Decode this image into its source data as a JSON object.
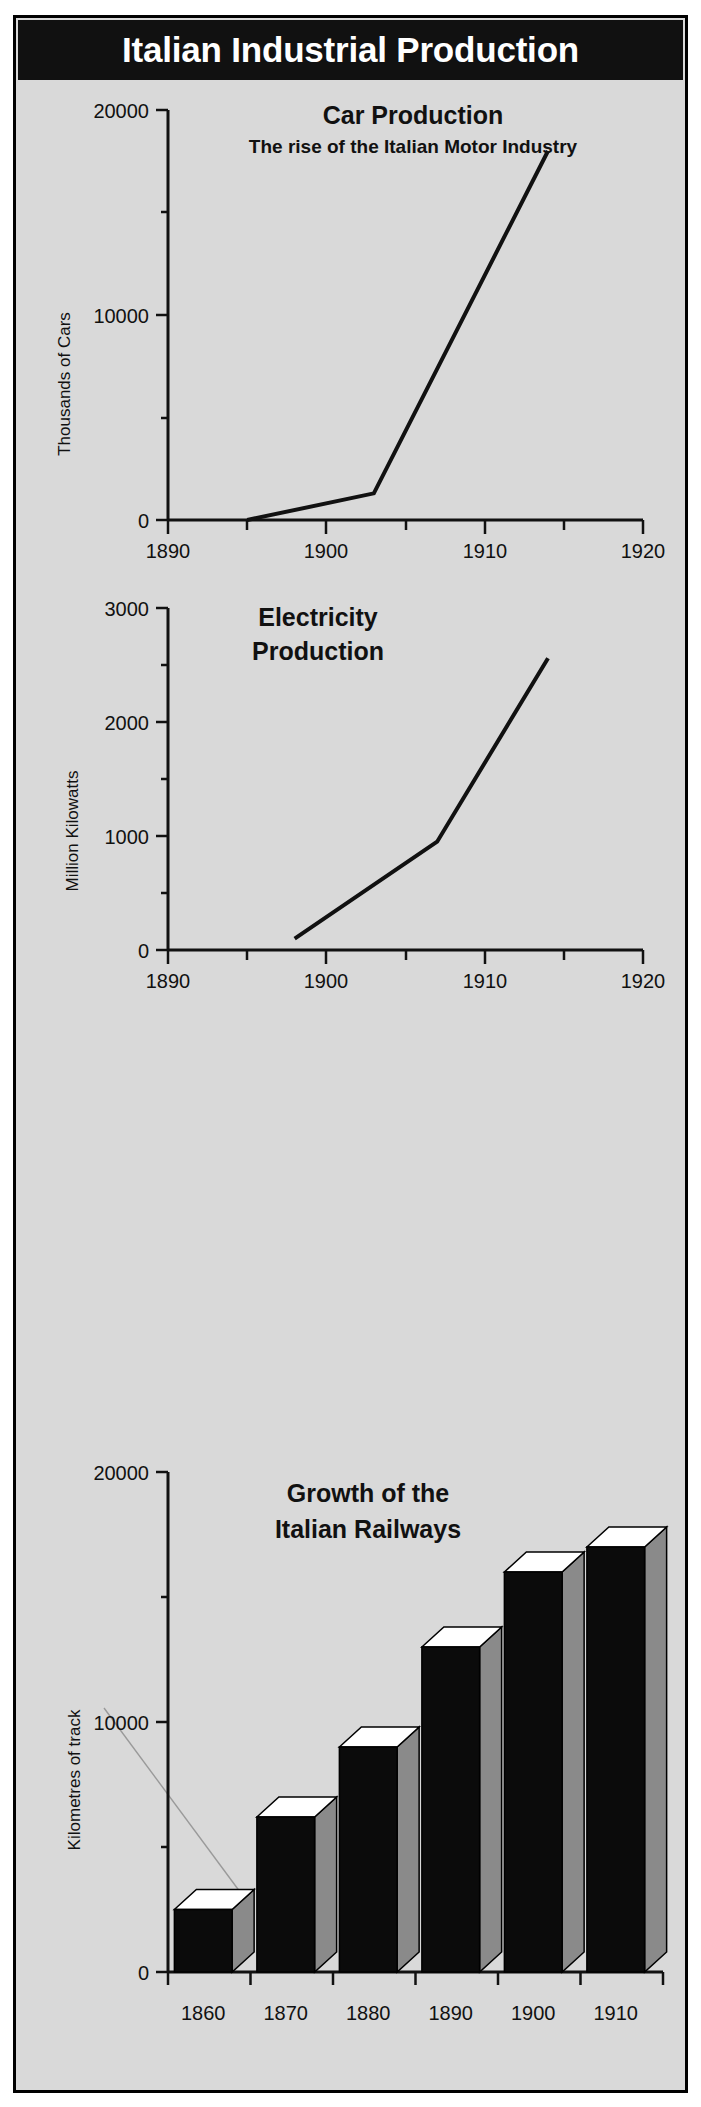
{
  "poster": {
    "title": "Italian Industrial Production",
    "background_color": "#d9d9d9",
    "banner_color": "#111111",
    "banner_text_color": "#ffffff",
    "frame_color": "#000000"
  },
  "charts": [
    {
      "id": "car-production",
      "title": "Car Production",
      "subtitle": "The rise of the Italian Motor Industry",
      "ylabel": "Thousands of Cars",
      "ytick_labels": [
        "0",
        "10000",
        "20000"
      ],
      "xtick_labels": [
        "1890",
        "1900",
        "1910",
        "1920"
      ]
    },
    {
      "id": "electricity-production",
      "title_line1": "Electricity",
      "title_line2": "Production",
      "ylabel": "Million Kilowatts",
      "ytick_labels": [
        "0",
        "1000",
        "2000",
        "3000"
      ],
      "xtick_labels": [
        "1890",
        "1900",
        "1910",
        "1920"
      ]
    },
    {
      "id": "italian-railways",
      "title_line1": "Growth of the",
      "title_line2": "Italian Railways",
      "ylabel": "Kilometres of track",
      "ytick_labels": [
        "0",
        "10000",
        "20000"
      ],
      "xtick_labels": [
        "1860",
        "1870",
        "1880",
        "1890",
        "1900",
        "1910"
      ]
    }
  ],
  "chart_data": [
    {
      "type": "line",
      "title": "Car Production",
      "subtitle": "The rise of the Italian Motor Industry",
      "xlabel": "",
      "ylabel": "Thousands of Cars",
      "xlim": [
        1890,
        1920
      ],
      "ylim": [
        0,
        20000
      ],
      "xticks": [
        1890,
        1900,
        1910,
        1920
      ],
      "yticks": [
        0,
        10000,
        20000
      ],
      "yminor_ticks": [
        5000,
        15000
      ],
      "grid": false,
      "legend": "none",
      "series": [
        {
          "name": "Car production",
          "x": [
            1895,
            1903,
            1914
          ],
          "values": [
            0,
            1300,
            18000
          ]
        }
      ]
    },
    {
      "type": "line",
      "title": "Electricity Production",
      "subtitle": "",
      "xlabel": "",
      "ylabel": "Million Kilowatts",
      "xlim": [
        1890,
        1920
      ],
      "ylim": [
        0,
        3000
      ],
      "xticks": [
        1890,
        1900,
        1910,
        1920
      ],
      "yticks": [
        0,
        1000,
        2000,
        3000
      ],
      "yminor_ticks": [
        500,
        1500,
        2500
      ],
      "grid": false,
      "legend": "none",
      "series": [
        {
          "name": "Electricity production",
          "x": [
            1898,
            1907,
            1914
          ],
          "values": [
            100,
            950,
            2560
          ]
        }
      ]
    },
    {
      "type": "bar",
      "title": "Growth of the Italian Railways",
      "subtitle": "",
      "xlabel": "",
      "ylabel": "Kilometres of track",
      "categories": [
        "1860",
        "1870",
        "1880",
        "1890",
        "1900",
        "1910"
      ],
      "values": [
        2500,
        6200,
        9000,
        13000,
        16000,
        17000
      ],
      "ylim": [
        0,
        20000
      ],
      "yticks": [
        0,
        10000,
        20000
      ],
      "yminor_ticks": [
        5000,
        15000
      ],
      "grid": false,
      "legend": "none",
      "style": "3d-blocks",
      "bar_face_color": "#0b0b0b",
      "bar_side_color": "#8a8a8a",
      "bar_top_color": "#ffffff"
    }
  ]
}
